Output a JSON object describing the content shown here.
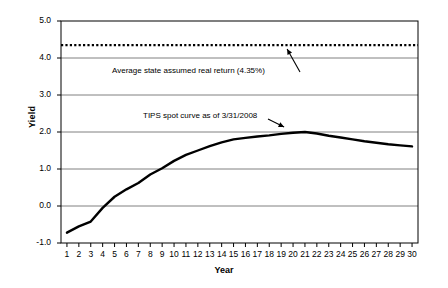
{
  "chart_data": {
    "type": "line",
    "title": "",
    "xlabel": "Year",
    "ylabel": "Yield",
    "xlim": [
      0.5,
      30.5
    ],
    "ylim": [
      -1.0,
      5.0
    ],
    "grid": true,
    "legend": "none",
    "xticks": [
      "1",
      "2",
      "3",
      "4",
      "5",
      "6",
      "7",
      "8",
      "9",
      "10",
      "11",
      "12",
      "13",
      "14",
      "15",
      "16",
      "17",
      "18",
      "19",
      "20",
      "21",
      "22",
      "23",
      "24",
      "25",
      "26",
      "27",
      "28",
      "29",
      "30"
    ],
    "yticks": [
      "-1.0",
      "0.0",
      "1.0",
      "2.0",
      "3.0",
      "4.0",
      "5.0"
    ],
    "x": [
      1,
      2,
      3,
      4,
      5,
      6,
      7,
      8,
      9,
      10,
      11,
      12,
      13,
      14,
      15,
      16,
      17,
      18,
      19,
      20,
      21,
      22,
      23,
      24,
      25,
      26,
      27,
      28,
      29,
      30
    ],
    "series": [
      {
        "name": "TIPS spot curve as of 3/31/2008",
        "style": "solid",
        "color": "#000000",
        "values": [
          -0.72,
          -0.55,
          -0.42,
          -0.05,
          0.25,
          0.45,
          0.62,
          0.85,
          1.02,
          1.22,
          1.38,
          1.5,
          1.62,
          1.72,
          1.8,
          1.84,
          1.88,
          1.91,
          1.95,
          1.98,
          2.0,
          1.96,
          1.9,
          1.85,
          1.8,
          1.75,
          1.71,
          1.67,
          1.64,
          1.61
        ]
      },
      {
        "name": "Average state assumed real return (4.35%)",
        "style": "dotted",
        "color": "#000000",
        "constant": 4.35,
        "values": [
          4.35,
          4.35,
          4.35,
          4.35,
          4.35,
          4.35,
          4.35,
          4.35,
          4.35,
          4.35,
          4.35,
          4.35,
          4.35,
          4.35,
          4.35,
          4.35,
          4.35,
          4.35,
          4.35,
          4.35,
          4.35,
          4.35,
          4.35,
          4.35,
          4.35,
          4.35,
          4.35,
          4.35,
          4.35,
          4.35
        ]
      }
    ],
    "annotations": [
      {
        "text": "Average state assumed real return (4.35%)",
        "target_x": 19.5,
        "target_y": 4.35
      },
      {
        "text": "TIPS spot curve as of 3/31/2008",
        "target_x": 19.5,
        "target_y": 2.0
      }
    ]
  },
  "axis": {
    "ylabel": "Yield",
    "xlabel": "Year",
    "ytick_labels": [
      "5.0",
      "4.0",
      "3.0",
      "2.0",
      "1.0",
      "0.0",
      "-1.0"
    ],
    "xtick_labels": [
      "1",
      "2",
      "3",
      "4",
      "5",
      "6",
      "7",
      "8",
      "9",
      "10",
      "11",
      "12",
      "13",
      "14",
      "15",
      "16",
      "17",
      "18",
      "19",
      "20",
      "21",
      "22",
      "23",
      "24",
      "25",
      "26",
      "27",
      "28",
      "29",
      "30"
    ]
  },
  "annotations": {
    "assumed_return": "Average state assumed real return (4.35%)",
    "tips_curve": "TIPS spot curve as of 3/31/2008"
  },
  "colors": {
    "line": "#000000",
    "grid": "#808080",
    "frame": "#000000",
    "background": "#ffffff"
  }
}
